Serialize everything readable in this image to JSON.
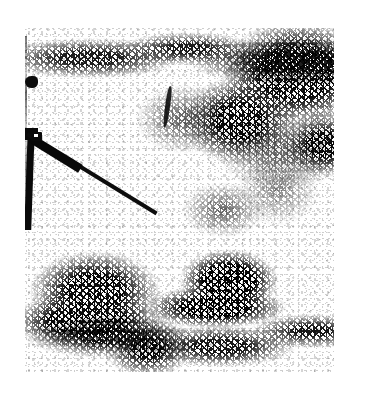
{
  "image": {
    "kind": "halftone-photograph",
    "caption_alt": "Coarsely dithered black-and-white photograph of a rifle resting at an angle on the ground in front of dense low scrub and brush",
    "rendering": "black-and-white dithered halftone reproduction",
    "background_color": "#ffffff",
    "ink_color": "#0a0a0a",
    "canvas": {
      "width": 365,
      "height": 400
    },
    "plate": {
      "left": 25,
      "top": 28,
      "width": 309,
      "height": 344
    }
  },
  "scene": {
    "subject_label": "rifle",
    "ground_label": "bare light ground",
    "regions": [
      {
        "name": "upper scrub band",
        "position": "top edge",
        "density": "medium"
      },
      {
        "name": "heavy foliage thicket",
        "position": "upper right",
        "density": "very high"
      },
      {
        "name": "scattered twigs and debris",
        "position": "center",
        "density": "low"
      },
      {
        "name": "bush mass",
        "position": "lower left",
        "density": "high"
      },
      {
        "name": "dark bush mass",
        "position": "lower center",
        "density": "very high"
      },
      {
        "name": "scrub band",
        "position": "bottom edge",
        "density": "medium"
      }
    ]
  },
  "rifle": {
    "parts": [
      {
        "name": "stock",
        "orientation": "vertical"
      },
      {
        "name": "receiver",
        "orientation": "diagonal"
      },
      {
        "name": "barrel",
        "orientation": "diagonal down-right"
      },
      {
        "name": "sight",
        "orientation": "raised"
      }
    ],
    "barrel_angle_degrees": 31.5
  }
}
